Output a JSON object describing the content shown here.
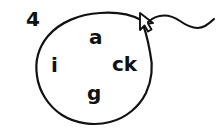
{
  "canvas": {
    "width": 218,
    "height": 129,
    "background_color": "#ffffff",
    "ink_color": "#111111"
  },
  "item": {
    "number_label": "4"
  },
  "circled_group": {
    "shape": "hand-drawn-oval",
    "stroke_color": "#111111",
    "letters": [
      {
        "text": "a",
        "name": "letter-a"
      },
      {
        "text": "i",
        "name": "letter-i"
      },
      {
        "text": "ck",
        "name": "letter-ck"
      },
      {
        "text": "g",
        "name": "letter-g"
      }
    ]
  },
  "cursor": {
    "icon": "mouse-pointer-icon",
    "color": "#111111"
  },
  "trail": {
    "icon": "wavy-line-icon",
    "color": "#111111"
  }
}
